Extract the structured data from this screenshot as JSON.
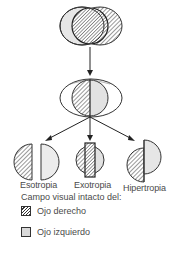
{
  "diagram": {
    "top_figure": "binocular visual field overlap (both eyes)",
    "middle_figure": "fused visual field split by eye",
    "outcomes": [
      {
        "label": "Esotropia"
      },
      {
        "label": "Exotropia"
      },
      {
        "label": "Hipertropia"
      }
    ]
  },
  "legend": {
    "title": "Campo visual intacto del:",
    "items": [
      {
        "label": "Ojo derecho",
        "pattern": "hatched"
      },
      {
        "label": "Ojo izquierdo",
        "pattern": "gray"
      }
    ]
  },
  "colors": {
    "stroke": "#333333",
    "left_eye_fill": "#d9d9d9",
    "hatch": "#333333",
    "text": "#4a4a4a"
  }
}
